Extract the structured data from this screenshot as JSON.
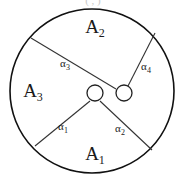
{
  "figure": {
    "caption_clipped": "( , )",
    "regions": [
      {
        "id": "A1",
        "base": "A",
        "sub": "1",
        "x": 95,
        "y": 160
      },
      {
        "id": "A2",
        "base": "A",
        "sub": "2",
        "x": 95,
        "y": 33
      },
      {
        "id": "A3",
        "base": "A",
        "sub": "3",
        "x": 33,
        "y": 97
      }
    ],
    "angles": [
      {
        "id": "a1",
        "base": "α",
        "sub": "1",
        "x": 63,
        "y": 130
      },
      {
        "id": "a2",
        "base": "α",
        "sub": "2",
        "x": 120,
        "y": 132
      },
      {
        "id": "a3",
        "base": "α",
        "sub": "3",
        "x": 65,
        "y": 67
      },
      {
        "id": "a4",
        "base": "α",
        "sub": "4",
        "x": 146,
        "y": 70
      }
    ],
    "outer_circle": {
      "cx": 92,
      "cy": 91,
      "r": 82
    },
    "nodes": [
      {
        "id": "node-left",
        "cx": 95,
        "cy": 93,
        "r": 8
      },
      {
        "id": "node-right",
        "cx": 124,
        "cy": 93,
        "r": 8
      }
    ],
    "dividers": [
      {
        "id": "divider-a3",
        "d": "M 31 38 L 116 89"
      },
      {
        "id": "divider-a4",
        "d": "M 155 33 L 128 86"
      },
      {
        "id": "divider-a1",
        "d": "M 35 146 L 90 101"
      },
      {
        "id": "divider-a2",
        "d": "M 152 150 L 100 101"
      }
    ],
    "colors": {
      "stroke": "#111111",
      "divider": "#333333",
      "text": "#1a1a1a",
      "background": "#ffffff"
    }
  }
}
